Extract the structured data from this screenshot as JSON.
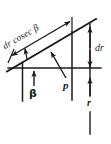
{
  "figure": {
    "type": "geometry-diagram",
    "background_color": "#ffffff",
    "stroke_color": "#1a1a1a",
    "labels": {
      "slant_length": {
        "prefix_italic": "d",
        "prefix_italic_2": "r",
        "function": "cosec",
        "angle_symbol": "β",
        "full_text": "dr cosec β"
      },
      "rise": {
        "full_text": "dr",
        "italic_d": "d",
        "italic_r": "r"
      },
      "angle": {
        "full_text": "β"
      },
      "perpendicular": {
        "full_text": "p"
      },
      "radius": {
        "full_text": "r"
      }
    },
    "geometry": {
      "inclined_line": {
        "x1": 7,
        "y1": 71,
        "x2": 96,
        "y2": 19
      },
      "horizontal_line": {
        "x1": 8,
        "y1": 68,
        "x2": 101,
        "y2": 68
      },
      "vertical_left": {
        "x": 22,
        "y1": 65,
        "y2": 101
      },
      "vertical_mid": {
        "x": 72,
        "y1": 32,
        "y2": 100
      },
      "vertical_right": {
        "x": 90,
        "y1": 24,
        "y2": 134
      },
      "dimension_slant": {
        "x1": 10,
        "y1": 56,
        "x2": 72,
        "y2": 20
      },
      "dimension_rise": {
        "x": 90,
        "y1": 28,
        "y2": 68
      },
      "angle_degrees": 30
    }
  }
}
